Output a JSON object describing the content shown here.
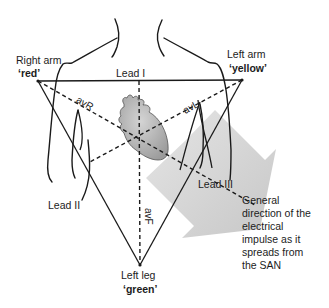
{
  "diagram": {
    "type": "einthoven-triangle-ecg-leads",
    "electrodes": {
      "right_arm": {
        "label": "Right arm",
        "color_name": "‘red’"
      },
      "left_arm": {
        "label": "Left arm",
        "color_name": "‘yellow’"
      },
      "left_leg": {
        "label": "Left leg",
        "color_name": "‘green’"
      }
    },
    "leads": {
      "lead_i": "Lead I",
      "lead_ii": "Lead II",
      "lead_iii": "Lead III",
      "avr": "avR",
      "avl": "avL",
      "avf": "avF"
    },
    "arrow_caption": "General direction of the electrical impulse as it spreads from the SAN",
    "arrow_caption_lines": [
      "General",
      "direction of the",
      "electrical",
      "impulse as it",
      "spreads from",
      "the SAN"
    ],
    "colors": {
      "line": "#1a1a1a",
      "heart_fill": "#a9a9a9",
      "arrow_fill": "#cfcfcf"
    }
  }
}
